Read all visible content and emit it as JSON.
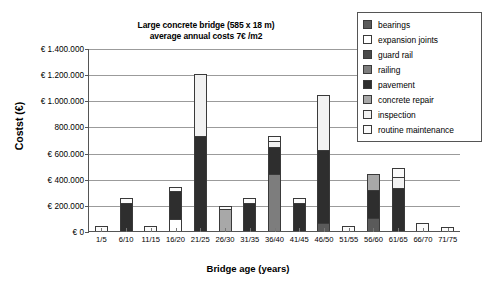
{
  "chart_data": {
    "type": "bar",
    "stacked": true,
    "title": "Large concrete bridge (585 x 18 m)\naverage annual costs 7€ /m2",
    "title_lines": [
      "Large concrete bridge (585 x 18 m)",
      "average annual costs 7€ /m2"
    ],
    "xlabel": "Bridge age (years)",
    "ylabel": "Costst (€)",
    "ylim": [
      0,
      1400000
    ],
    "ytick_step": 200000,
    "ytick_labels": [
      "€ 0",
      "€ 200.000",
      "€ 400.000",
      "€ 600.000",
      "800.000",
      "€ 1.000.000",
      "€ 1.200.000",
      "€ 1.400.000"
    ],
    "ytick_values": [
      0,
      200000,
      400000,
      600000,
      800000,
      1000000,
      1200000,
      1400000
    ],
    "grid": true,
    "legend_position": "top-right",
    "categories": [
      "1/5",
      "6/10",
      "11/15",
      "16/20",
      "21/25",
      "26/30",
      "31/35",
      "36/40",
      "41/45",
      "46/50",
      "51/55",
      "56/60",
      "61/65",
      "66/70",
      "71/75"
    ],
    "series": [
      {
        "name": "bearings",
        "color": "#5a5a5a",
        "values": [
          0,
          0,
          0,
          0,
          0,
          0,
          0,
          0,
          0,
          60000,
          0,
          100000,
          0,
          0,
          0
        ]
      },
      {
        "name": "expansion joints",
        "color": "#ffffff",
        "values": [
          0,
          0,
          0,
          90000,
          0,
          0,
          0,
          0,
          0,
          0,
          0,
          0,
          0,
          0,
          0
        ]
      },
      {
        "name": "guard rail",
        "color": "#4a4a4a",
        "values": [
          0,
          0,
          0,
          0,
          0,
          0,
          0,
          0,
          0,
          0,
          0,
          0,
          0,
          0,
          0
        ]
      },
      {
        "name": "railing",
        "color": "#7d7d7d",
        "values": [
          0,
          0,
          0,
          0,
          0,
          0,
          0,
          440000,
          0,
          0,
          0,
          0,
          0,
          0,
          0
        ]
      },
      {
        "name": "pavement",
        "color": "#2e2e2e",
        "values": [
          0,
          215000,
          0,
          215000,
          730000,
          0,
          215000,
          200000,
          215000,
          560000,
          0,
          215000,
          330000,
          0,
          0
        ]
      },
      {
        "name": "concrete repair",
        "color": "#a8a8a8",
        "values": [
          0,
          0,
          0,
          0,
          0,
          170000,
          0,
          0,
          0,
          0,
          0,
          125000,
          0,
          0,
          0
        ]
      },
      {
        "name": "inspection",
        "color": "#f2f2f2",
        "values": [
          0,
          0,
          0,
          0,
          470000,
          0,
          0,
          50000,
          0,
          420000,
          0,
          0,
          80000,
          0,
          0
        ]
      },
      {
        "name": "routine maintenance",
        "color": "#fbfbfb",
        "values": [
          40000,
          35000,
          35000,
          35000,
          0,
          25000,
          35000,
          35000,
          35000,
          0,
          35000,
          0,
          70000,
          65000,
          30000
        ]
      }
    ],
    "totals": [
      40000,
      250000,
      35000,
      340000,
      1200000,
      195000,
      250000,
      1040000,
      250000,
      1040000,
      35000,
      440000,
      480000,
      65000,
      30000
    ]
  },
  "legend": {
    "items": [
      {
        "label": "bearings",
        "color": "#5a5a5a"
      },
      {
        "label": "expansion joints",
        "color": "#ffffff"
      },
      {
        "label": "guard rail",
        "color": "#4a4a4a"
      },
      {
        "label": "railing",
        "color": "#7d7d7d"
      },
      {
        "label": "pavement",
        "color": "#2e2e2e"
      },
      {
        "label": "concrete repair",
        "color": "#a8a8a8"
      },
      {
        "label": "inspection",
        "color": "#f2f2f2"
      },
      {
        "label": "routine maintenance",
        "color": "#fbfbfb"
      }
    ]
  }
}
